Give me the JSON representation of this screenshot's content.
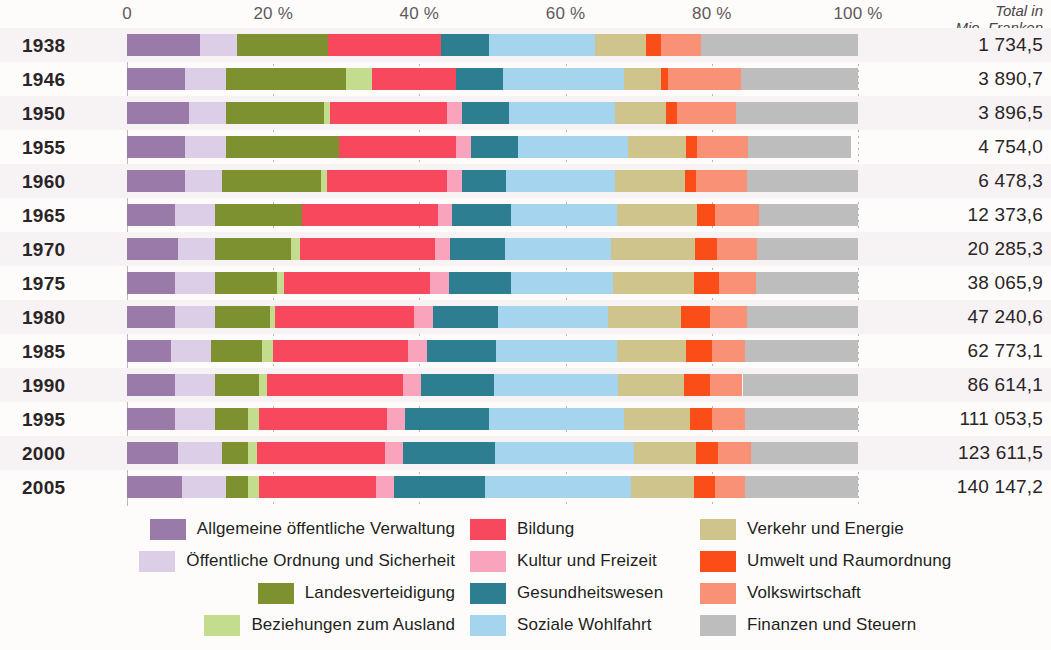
{
  "chart_data": {
    "type": "bar",
    "subtype": "stacked-horizontal-100-percent",
    "title": "",
    "xlabel": "",
    "ylabel": "",
    "xlim": [
      0,
      100
    ],
    "grid": true,
    "legend_position": "bottom",
    "x_ticks": [
      "0",
      "20 %",
      "40 %",
      "60 %",
      "80 %",
      "100 %"
    ],
    "x_tick_values": [
      0,
      20,
      40,
      60,
      80,
      100
    ],
    "total_header_line1": "Total in",
    "total_header_line2": "Mio. Franken",
    "categories": [
      "1938",
      "1946",
      "1950",
      "1955",
      "1960",
      "1965",
      "1970",
      "1975",
      "1980",
      "1985",
      "1990",
      "1995",
      "2000",
      "2005"
    ],
    "totals": [
      "1 734,5",
      "3 890,7",
      "3 896,5",
      "4 754,0",
      "6 478,3",
      "12 373,6",
      "20 285,3",
      "38 065,9",
      "47 240,6",
      "62 773,1",
      "86 614,1",
      "111 053,5",
      "123 611,5",
      "140 147,2"
    ],
    "series": [
      {
        "name": "Allgemeine öffentliche Verwaltung",
        "color": "#9a7aa8",
        "values": [
          10.0,
          8.0,
          8.5,
          8.0,
          8.0,
          6.5,
          7.0,
          6.5,
          6.5,
          6.0,
          6.5,
          6.5,
          7.0,
          7.5
        ]
      },
      {
        "name": "Öffentliche Ordnung und Sicherheit",
        "color": "#dccee6",
        "values": [
          5.0,
          5.5,
          5.0,
          5.5,
          5.0,
          5.5,
          5.0,
          5.5,
          5.5,
          5.5,
          5.5,
          5.5,
          6.0,
          6.0
        ]
      },
      {
        "name": "Landesverteidigung",
        "color": "#7d9130",
        "values": [
          12.5,
          16.5,
          13.5,
          15.5,
          13.5,
          12.0,
          10.5,
          8.5,
          7.5,
          7.0,
          6.0,
          4.5,
          3.5,
          3.0
        ]
      },
      {
        "name": "Beziehungen zum Ausland",
        "color": "#c4dc8d",
        "values": [
          0.0,
          3.5,
          0.8,
          0.0,
          0.8,
          0.0,
          1.2,
          1.0,
          0.8,
          1.5,
          1.2,
          1.5,
          1.3,
          1.5
        ]
      },
      {
        "name": "Bildung",
        "color": "#f8485e",
        "values": [
          15.5,
          11.5,
          16.0,
          16.0,
          16.5,
          18.5,
          18.5,
          20.0,
          19.0,
          18.5,
          18.5,
          17.5,
          17.5,
          16.0
        ]
      },
      {
        "name": "Kultur und Freizeit",
        "color": "#f9a3bc",
        "values": [
          0.0,
          0.0,
          2.0,
          2.0,
          2.0,
          2.0,
          2.0,
          2.5,
          2.5,
          2.5,
          2.5,
          2.5,
          2.5,
          2.5
        ]
      },
      {
        "name": "Gesundheitswesen",
        "color": "#2e7e92",
        "values": [
          6.5,
          6.5,
          6.5,
          6.5,
          6.0,
          8.0,
          7.5,
          8.5,
          9.0,
          9.5,
          10.0,
          11.5,
          12.5,
          12.5
        ]
      },
      {
        "name": "Soziale Wohlfahrt",
        "color": "#a5d4ee",
        "values": [
          14.5,
          16.5,
          14.5,
          15.0,
          15.0,
          14.5,
          14.5,
          14.0,
          15.0,
          16.5,
          17.0,
          18.5,
          19.0,
          20.0
        ]
      },
      {
        "name": "Verkehr und Energie",
        "color": "#cfc58c",
        "values": [
          7.0,
          5.0,
          7.0,
          8.0,
          9.5,
          11.0,
          11.5,
          11.0,
          10.0,
          9.5,
          9.0,
          9.0,
          8.5,
          8.5
        ]
      },
      {
        "name": "Umwelt und Raumordnung",
        "color": "#fb4d18",
        "values": [
          2.0,
          1.0,
          1.5,
          1.5,
          1.5,
          2.5,
          3.0,
          3.5,
          4.0,
          3.5,
          3.5,
          3.0,
          3.0,
          3.0
        ]
      },
      {
        "name": "Volkswirtschaft",
        "color": "#f99177",
        "values": [
          5.5,
          10.0,
          8.0,
          7.0,
          7.0,
          6.0,
          5.5,
          5.0,
          5.0,
          4.5,
          4.5,
          4.5,
          4.5,
          4.0
        ]
      },
      {
        "name": "Finanzen und Steuern",
        "color": "#bdbdbd",
        "values": [
          21.5,
          16.0,
          16.7,
          14.0,
          15.2,
          13.5,
          13.8,
          14.0,
          15.2,
          15.5,
          15.8,
          15.5,
          14.7,
          15.5
        ]
      }
    ]
  },
  "legend": {
    "columns": [
      {
        "items": [
          {
            "label": "Allgemeine öffentliche Verwaltung",
            "color": "#9a7aa8"
          },
          {
            "label": "Öffentliche Ordnung und Sicherheit",
            "color": "#dccee6"
          },
          {
            "label": "Landesverteidigung",
            "color": "#7d9130"
          },
          {
            "label": "Beziehungen zum Ausland",
            "color": "#c4dc8d"
          }
        ]
      },
      {
        "items": [
          {
            "label": "Bildung",
            "color": "#f8485e"
          },
          {
            "label": "Kultur und Freizeit",
            "color": "#f9a3bc"
          },
          {
            "label": "Gesundheitswesen",
            "color": "#2e7e92"
          },
          {
            "label": "Soziale Wohlfahrt",
            "color": "#a5d4ee"
          }
        ]
      },
      {
        "items": [
          {
            "label": "Verkehr und Energie",
            "color": "#cfc58c"
          },
          {
            "label": "Umwelt und Raumordnung",
            "color": "#fb4d18"
          },
          {
            "label": "Volkswirtschaft",
            "color": "#f99177"
          },
          {
            "label": "Finanzen und Steuern",
            "color": "#bdbdbd"
          }
        ]
      }
    ]
  }
}
